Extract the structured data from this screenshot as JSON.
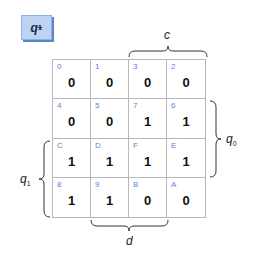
{
  "title": {
    "main": "q",
    "subscript": "1",
    "superscript": "+"
  },
  "colors": {
    "title_fill": "#bcd4f2",
    "title_shadow": "#5b86cc",
    "index_text": "#5b86cc",
    "grid_line": "#b8b8b8"
  },
  "kmap": {
    "rows": [
      [
        {
          "index": "0",
          "value": "0"
        },
        {
          "index": "1",
          "value": "0"
        },
        {
          "index": "3",
          "value": "0"
        },
        {
          "index": "2",
          "value": "0"
        }
      ],
      [
        {
          "index": "4",
          "value": "0"
        },
        {
          "index": "5",
          "value": "0"
        },
        {
          "index": "7",
          "value": "1"
        },
        {
          "index": "6",
          "value": "1"
        }
      ],
      [
        {
          "index": "C",
          "value": "1"
        },
        {
          "index": "D",
          "value": "1"
        },
        {
          "index": "F",
          "value": "1"
        },
        {
          "index": "E",
          "value": "1"
        }
      ],
      [
        {
          "index": "8",
          "value": "1"
        },
        {
          "index": "9",
          "value": "1"
        },
        {
          "index": "B",
          "value": "0"
        },
        {
          "index": "A",
          "value": "0"
        }
      ]
    ]
  },
  "labels": {
    "top": "c",
    "bottom": "d",
    "right": {
      "main": "q",
      "subscript": "0"
    },
    "left": {
      "main": "q",
      "subscript": "1"
    }
  }
}
